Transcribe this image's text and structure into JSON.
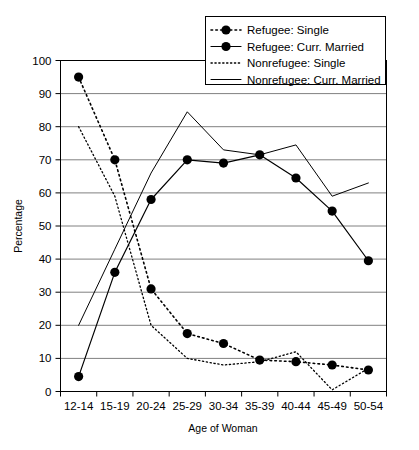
{
  "chart_data": {
    "type": "line",
    "title": "",
    "xlabel": "Age of Woman",
    "ylabel": "Percentage",
    "categories": [
      "12-14",
      "15-19",
      "20-24",
      "25-29",
      "30-34",
      "35-39",
      "40-44",
      "45-49",
      "50-54"
    ],
    "ylim": [
      0,
      100
    ],
    "yticks": [
      0,
      10,
      20,
      30,
      40,
      50,
      60,
      70,
      80,
      90,
      100
    ],
    "grid": true,
    "legend_position": "top-right",
    "series": [
      {
        "name": "Refugee: Single",
        "style": "dotted-with-markers",
        "marker": "filled-circle",
        "values": [
          95,
          70,
          31,
          17.5,
          14.5,
          9.5,
          9,
          8,
          6.5
        ]
      },
      {
        "name": "Refugee: Curr. Married",
        "style": "solid-with-markers",
        "marker": "filled-circle",
        "values": [
          4.5,
          36,
          58,
          70,
          69,
          71.5,
          64.5,
          54.5,
          39.5
        ]
      },
      {
        "name": "Nonrefugee: Single",
        "style": "fine-dotted",
        "marker": "none",
        "values": [
          80,
          59,
          20,
          10,
          8,
          9,
          12,
          0.5,
          7
        ]
      },
      {
        "name": "Nonrefugee: Curr. Married",
        "style": "solid-thin",
        "marker": "none",
        "values": [
          20,
          43,
          66,
          84.5,
          73,
          71.5,
          74.5,
          59,
          63
        ]
      }
    ]
  },
  "legend": {
    "entries": [
      {
        "label": "Refugee: Single"
      },
      {
        "label": "Refugee: Curr. Married"
      },
      {
        "label": "Nonrefugee: Single"
      },
      {
        "label": "Nonrefugee: Curr. Married"
      }
    ]
  },
  "axes": {
    "y_title": "Percentage",
    "x_title": "Age of Woman",
    "y_tick_labels": [
      "100",
      "90",
      "80",
      "70",
      "60",
      "50",
      "40",
      "30",
      "20",
      "10",
      "0"
    ],
    "x_tick_labels": [
      "12-14",
      "15-19",
      "20-24",
      "25-29",
      "30-34",
      "35-39",
      "40-44",
      "45-49",
      "50-54"
    ]
  },
  "colors": {
    "line": "#000000",
    "grid": "#808080",
    "background": "#ffffff"
  }
}
